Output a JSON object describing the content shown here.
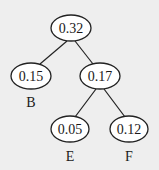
{
  "diagram": {
    "type": "huffman-tree",
    "background": "#eeeeee",
    "stroke": "#222222",
    "nodes": [
      {
        "id": "root",
        "value": "0.32",
        "label": "",
        "cx": 71,
        "cy": 28
      },
      {
        "id": "n015",
        "value": "0.15",
        "label": "B",
        "cx": 31,
        "cy": 76
      },
      {
        "id": "n017",
        "value": "0.17",
        "label": "",
        "cx": 100,
        "cy": 76
      },
      {
        "id": "n005",
        "value": "0.05",
        "label": "E",
        "cx": 70,
        "cy": 129
      },
      {
        "id": "n012",
        "value": "0.12",
        "label": "F",
        "cx": 129,
        "cy": 129
      }
    ],
    "edges": [
      {
        "from": "root",
        "to": "n015"
      },
      {
        "from": "root",
        "to": "n017"
      },
      {
        "from": "n017",
        "to": "n005"
      },
      {
        "from": "n017",
        "to": "n012"
      }
    ]
  }
}
